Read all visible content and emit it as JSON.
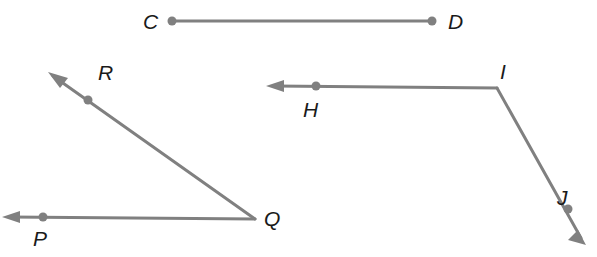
{
  "figure": {
    "background_color": "#ffffff",
    "stroke_color": "#808080",
    "point_color": "#808080",
    "label_color": "#1a1a1a",
    "stroke_width": 3,
    "point_radius": 4.5,
    "width": 597,
    "height": 257
  },
  "shapes": [
    {
      "id": "segment-cd",
      "kind": "segment",
      "name": "segment CD",
      "endpoints": [
        {
          "label": "C",
          "x": 172,
          "y": 21
        },
        {
          "label": "D",
          "x": 432,
          "y": 21
        }
      ],
      "arrows": []
    },
    {
      "id": "angle-pqr",
      "kind": "angle",
      "name": "angle PQR",
      "vertex": {
        "label": "Q",
        "x": 255,
        "y": 219
      },
      "rays": [
        {
          "id": "ray-qr",
          "through": {
            "label": "R",
            "x": 88,
            "y": 100
          },
          "arrow_tip": {
            "x": 48,
            "y": 72
          }
        },
        {
          "id": "ray-qp",
          "through": {
            "label": "P",
            "x": 43,
            "y": 217
          },
          "arrow_tip": {
            "x": 2,
            "y": 217
          }
        }
      ]
    },
    {
      "id": "angle-hij",
      "kind": "angle",
      "name": "angle HIJ",
      "vertex": {
        "label": "I",
        "x": 497,
        "y": 88
      },
      "rays": [
        {
          "id": "ray-ih",
          "through": {
            "label": "H",
            "x": 316,
            "y": 86
          },
          "arrow_tip": {
            "x": 266,
            "y": 86
          }
        },
        {
          "id": "ray-ij",
          "through": {
            "label": "J",
            "x": 568,
            "y": 209
          },
          "arrow_tip": {
            "x": 586,
            "y": 245
          }
        }
      ]
    }
  ],
  "labels": {
    "c": "C",
    "d": "D",
    "r": "R",
    "p": "P",
    "q": "Q",
    "h": "H",
    "i": "I",
    "j": "J"
  }
}
